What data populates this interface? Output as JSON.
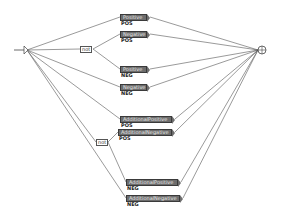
{
  "graph": {
    "initial_node": {
      "icon": "initial-state-arrow-icon"
    },
    "final_node": {
      "icon": "final-state-circle-icon"
    },
    "context_boxes": [
      {
        "label": "not",
        "x": 80,
        "y": 46
      },
      {
        "label": "not",
        "x": 96,
        "y": 139
      }
    ],
    "boxes": [
      {
        "label": "Positive",
        "output": "POS",
        "x": 120,
        "y": 14,
        "w": 27
      },
      {
        "label": "Negative",
        "output": "POS",
        "x": 120,
        "y": 31,
        "w": 27
      },
      {
        "label": "Positive",
        "output": "NEG",
        "x": 120,
        "y": 66,
        "w": 27
      },
      {
        "label": "Negative",
        "output": "NEG",
        "x": 120,
        "y": 84,
        "w": 27
      },
      {
        "label": "AdditionalPositive",
        "output": "POS",
        "x": 120,
        "y": 116,
        "w": 52
      },
      {
        "label": "AdditionalNegative",
        "output": "POS",
        "x": 118,
        "y": 129,
        "w": 54
      },
      {
        "label": "AdditionalPositive",
        "output": "NEG",
        "x": 126,
        "y": 179,
        "w": 52
      },
      {
        "label": "AdditionalNegative",
        "output": "NEG",
        "x": 126,
        "y": 195,
        "w": 54
      }
    ]
  }
}
